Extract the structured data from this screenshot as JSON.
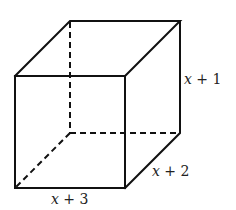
{
  "figure": {
    "type": "rectangular prism (box) diagram",
    "labels": {
      "height": {
        "var": "x",
        "rest": " + 1",
        "full": "x + 1"
      },
      "depth": {
        "var": "x",
        "rest": " + 2",
        "full": "x + 2"
      },
      "width": {
        "var": "x",
        "rest": " + 3",
        "full": "x + 3"
      }
    },
    "colors": {
      "stroke": "#111111",
      "text": "#222222",
      "background": "#ffffff"
    },
    "hidden_edges": "dashed"
  }
}
